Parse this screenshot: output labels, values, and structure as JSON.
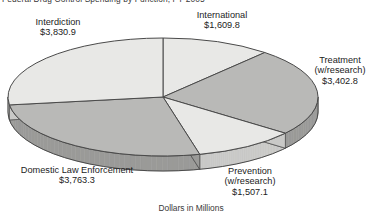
{
  "title": "Federal Drug Control Spending by Function, FY 2005",
  "caption": "Dollars in Millions",
  "labels": {
    "interdiction": {
      "name": "Interdiction",
      "value": "$3,830.9"
    },
    "international": {
      "name": "International",
      "value": "$1,609.8"
    },
    "treatment": {
      "name": "Treatment",
      "sub": "(w/research)",
      "value": "$3,402.8"
    },
    "prevention": {
      "name": "Prevention",
      "sub": "(w/research)",
      "value": "$1,507.1"
    },
    "domestic": {
      "name": "Domestic Law Enforcement",
      "value": "$3,763.3"
    }
  },
  "colors": {
    "light": "#e8e8e6",
    "medium": "#b9b9b7",
    "side_light": "#c9c9c7",
    "side_medium": "#9a9a98",
    "outline": "#4a4a4a",
    "text": "#1c1c1c"
  },
  "chart_data": {
    "type": "pie",
    "title": "Federal Drug Control Spending by Function, FY 2005",
    "subtitle": "Dollars in Millions",
    "unit": "millions of dollars",
    "total": 14113.9,
    "three_d": true,
    "legend": "labels-outside",
    "categories": [
      "International",
      "Treatment (w/research)",
      "Prevention (w/research)",
      "Domestic Law Enforcement",
      "Interdiction"
    ],
    "values": [
      1609.8,
      3402.8,
      1507.1,
      3763.3,
      3830.9
    ],
    "slices": [
      {
        "label": "International",
        "value": 1609.8,
        "display": "$1,609.8",
        "percent": 11.4,
        "fill": "light"
      },
      {
        "label": "Treatment (w/research)",
        "value": 3402.8,
        "display": "$3,402.8",
        "percent": 24.1,
        "fill": "medium"
      },
      {
        "label": "Prevention (w/research)",
        "value": 1507.1,
        "display": "$1,507.1",
        "percent": 10.7,
        "fill": "light"
      },
      {
        "label": "Domestic Law Enforcement",
        "value": 3763.3,
        "display": "$3,763.3",
        "percent": 26.7,
        "fill": "medium"
      },
      {
        "label": "Interdiction",
        "value": 3830.9,
        "display": "$3,830.9",
        "percent": 27.1,
        "fill": "light"
      }
    ]
  }
}
